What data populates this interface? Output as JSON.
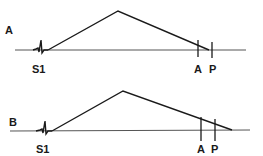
{
  "diagram": {
    "panels": [
      {
        "id": "A",
        "panel_label": "A",
        "s1_label": "S1",
        "a2_label": "A",
        "p2_label": "P",
        "baseline_y": 50,
        "murmur_shape": "crescendo-decrescendo (diamond)",
        "murmur_ends": "at P (extends through A2)"
      },
      {
        "id": "B",
        "panel_label": "B",
        "s1_label": "S1",
        "a2_label": "A",
        "p2_label": "P",
        "baseline_y": 131,
        "murmur_shape": "crescendo-decrescendo (diamond)",
        "murmur_ends": "beyond P (extends past P2)"
      }
    ],
    "colors": {
      "ink": "#1a1a1a",
      "baseline": "#555555",
      "background": "#ffffff"
    }
  }
}
